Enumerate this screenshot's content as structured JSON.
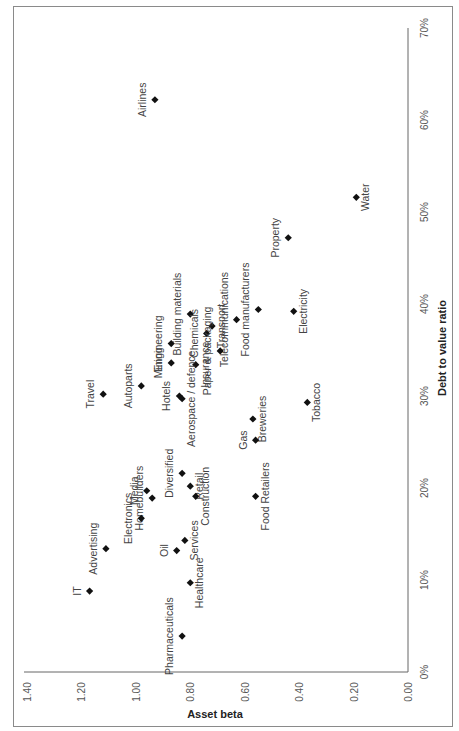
{
  "chart_data": {
    "type": "scatter",
    "title": "",
    "orientation": "rotated-90-clockwise",
    "xlabel": "Debt to value ratio",
    "ylabel": "Asset beta",
    "xlim": [
      0,
      70
    ],
    "ylim": [
      0,
      1.4
    ],
    "x_ticks": [
      "0%",
      "10%",
      "20%",
      "30%",
      "40%",
      "50%",
      "60%",
      "70%"
    ],
    "y_ticks": [
      "0.00",
      "0.20",
      "0.40",
      "0.60",
      "0.80",
      "1.00",
      "1.20",
      "1.40"
    ],
    "grid": false,
    "legend": "none",
    "points": [
      {
        "label": "Airlines",
        "x": 62.2,
        "y": 0.93,
        "side": "above"
      },
      {
        "label": "Water",
        "x": 51.6,
        "y": 0.19,
        "side": "below"
      },
      {
        "label": "Property",
        "x": 47.2,
        "y": 0.44,
        "side": "above"
      },
      {
        "label": "Food manufacturers",
        "x": 39.4,
        "y": 0.55,
        "side": "above"
      },
      {
        "label": "Electricity",
        "x": 39.2,
        "y": 0.42,
        "side": "below"
      },
      {
        "label": "Building materials",
        "x": 38.9,
        "y": 0.8,
        "side": "above"
      },
      {
        "label": "Telecommunications",
        "x": 38.3,
        "y": 0.63,
        "side": "above"
      },
      {
        "label": "Transport",
        "x": 37.6,
        "y": 0.72,
        "side": "below"
      },
      {
        "label": "Chemicals",
        "x": 36.8,
        "y": 0.74,
        "side": "above"
      },
      {
        "label": "Engineering",
        "x": 35.7,
        "y": 0.87,
        "side": "above"
      },
      {
        "label": "Paper & packaging",
        "x": 34.9,
        "y": 0.69,
        "side": "above"
      },
      {
        "label": "Mining",
        "x": 33.6,
        "y": 0.87,
        "side": "above"
      },
      {
        "label": "Insurance",
        "x": 33.4,
        "y": 0.78,
        "side": "below"
      },
      {
        "label": "Autoparts",
        "x": 31.1,
        "y": 0.98,
        "side": "above"
      },
      {
        "label": "Travel",
        "x": 30.2,
        "y": 1.12,
        "side": "above"
      },
      {
        "label": "Hotels",
        "x": 30.0,
        "y": 0.84,
        "side": "above"
      },
      {
        "label": "Aerospace / defence",
        "x": 29.7,
        "y": 0.83,
        "side": "below"
      },
      {
        "label": "Tobacco",
        "x": 29.3,
        "y": 0.37,
        "side": "below"
      },
      {
        "label": "Breweries",
        "x": 27.5,
        "y": 0.57,
        "side": "below"
      },
      {
        "label": "Gas",
        "x": 25.2,
        "y": 0.56,
        "side": "above"
      },
      {
        "label": "Diversified",
        "x": 21.6,
        "y": 0.83,
        "side": "above"
      },
      {
        "label": "Retail",
        "x": 20.2,
        "y": 0.8,
        "side": "below"
      },
      {
        "label": "Media",
        "x": 19.7,
        "y": 0.96,
        "side": "above"
      },
      {
        "label": "Construction",
        "x": 19.1,
        "y": 0.78,
        "side": "below"
      },
      {
        "label": "Food Retailers",
        "x": 19.1,
        "y": 0.56,
        "side": "below"
      },
      {
        "label": "Homebuilders",
        "x": 18.9,
        "y": 0.94,
        "side": "above"
      },
      {
        "label": "Electronics",
        "x": 16.7,
        "y": 0.98,
        "side": "above"
      },
      {
        "label": "Services",
        "x": 14.3,
        "y": 0.82,
        "side": "below"
      },
      {
        "label": "Advertising",
        "x": 13.4,
        "y": 1.11,
        "side": "above"
      },
      {
        "label": "Oil",
        "x": 13.2,
        "y": 0.85,
        "side": "above"
      },
      {
        "label": "Healthcare",
        "x": 9.7,
        "y": 0.8,
        "side": "below"
      },
      {
        "label": "IT",
        "x": 8.8,
        "y": 1.17,
        "side": "above"
      },
      {
        "label": "Pharmaceuticals",
        "x": 3.9,
        "y": 0.83,
        "side": "above"
      }
    ]
  },
  "colors": {
    "marker": "#111111",
    "axis": "#666666",
    "frame": "#8a8a8a",
    "text": "#444444"
  }
}
